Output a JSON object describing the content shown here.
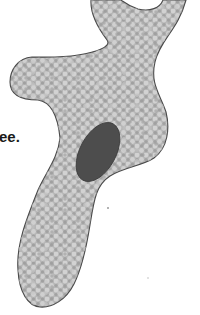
{
  "figure": {
    "caption_fragment": "ee.",
    "colors": {
      "background": "#ffffff",
      "cytoplasm_base": "#b4b4b4",
      "cytoplasm_dots_light": "#d0d0d0",
      "cytoplasm_dots_dark": "#9a9a9a",
      "outline": "#4a4a4a",
      "nucleus": "#4d4d4d"
    }
  }
}
